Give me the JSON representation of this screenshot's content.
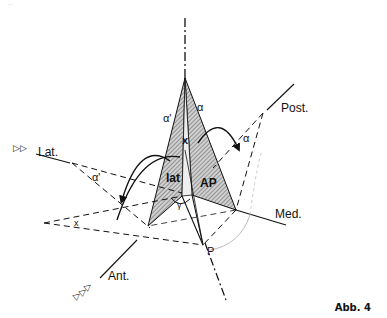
{
  "figure": {
    "caption": "Abb. 4",
    "corner_mark": "..."
  },
  "labels": {
    "lateral": "Lat.",
    "posterior": "Post.",
    "medial": "Med.",
    "anterior": "Ant.",
    "point_p": "P",
    "plane_lat": "lat",
    "plane_ap": "AP",
    "alpha": "α",
    "alpha_prime_top": "α'",
    "alpha_prime_left": "α'",
    "alpha_right": "α",
    "chi_center": "x",
    "chi_left": "x",
    "gamma": "γ"
  },
  "markers": {
    "lateral_arrows": "▷▷",
    "anterior_arrows": "▷▷▷"
  },
  "colors": {
    "ink": "#111111",
    "hatch": "#888888",
    "arc": "#bbbbbb"
  }
}
